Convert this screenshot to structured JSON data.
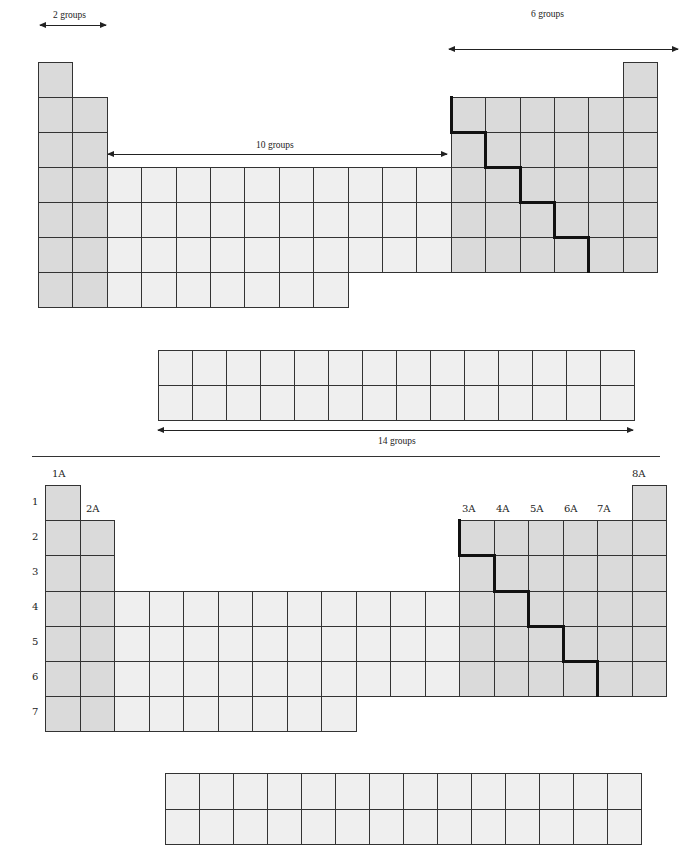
{
  "top_diagram": {
    "labels": {
      "s_block": "2 groups",
      "d_block": "10 groups",
      "p_block": "6 groups",
      "f_block": "14 groups"
    }
  },
  "bottom_diagram": {
    "group_labels": [
      "1A",
      "2A",
      "3A",
      "4A",
      "5A",
      "6A",
      "7A",
      "8A"
    ],
    "period_labels": [
      "1",
      "2",
      "3",
      "4",
      "5",
      "6",
      "7"
    ]
  },
  "colors": {
    "main_group": "#dadada",
    "transition": "#efefef",
    "grid": "#333333",
    "metal_nonmetal_line": "#111111"
  }
}
